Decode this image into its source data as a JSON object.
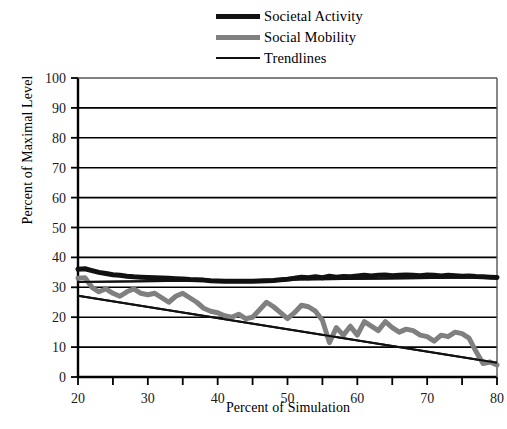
{
  "chart_data": {
    "type": "line",
    "title": "",
    "xlabel": "Percent of Simulation",
    "ylabel": "Percent of Maximal Level",
    "xlim": [
      20,
      80
    ],
    "ylim": [
      0,
      100
    ],
    "xticks": [
      20,
      25,
      30,
      35,
      40,
      45,
      50,
      55,
      60,
      65,
      70,
      75,
      80
    ],
    "xtick_labels": [
      "20",
      "",
      "30",
      "",
      "40",
      "",
      "50",
      "",
      "60",
      "",
      "70",
      "",
      "80"
    ],
    "yticks": [
      0,
      10,
      20,
      30,
      40,
      50,
      60,
      70,
      80,
      90,
      100
    ],
    "ytick_labels": [
      "0",
      "10",
      "20",
      "30",
      "40",
      "50",
      "60",
      "70",
      "80",
      "90",
      "100"
    ],
    "grid": "horizontal",
    "legend_position": "top-center",
    "legend": [
      {
        "label": "Societal Activity",
        "color": "#111111",
        "width": 5
      },
      {
        "label": "Social Mobility",
        "color": "#808080",
        "width": 5
      },
      {
        "label": "Trendlines",
        "color": "#111111",
        "width": 2
      }
    ],
    "x": [
      20,
      21,
      22,
      23,
      24,
      25,
      26,
      27,
      28,
      29,
      30,
      31,
      32,
      33,
      34,
      35,
      36,
      37,
      38,
      39,
      40,
      41,
      42,
      43,
      44,
      45,
      46,
      47,
      48,
      49,
      50,
      51,
      52,
      53,
      54,
      55,
      56,
      57,
      58,
      59,
      60,
      61,
      62,
      63,
      64,
      65,
      66,
      67,
      68,
      69,
      70,
      71,
      72,
      73,
      74,
      75,
      76,
      77,
      78,
      79,
      80
    ],
    "series": [
      {
        "name": "Societal Activity",
        "color": "#111111",
        "width": 5,
        "values": [
          36.0,
          36.2,
          35.6,
          35.0,
          34.6,
          34.2,
          34.0,
          33.7,
          33.5,
          33.4,
          33.3,
          33.2,
          33.1,
          33.0,
          32.9,
          32.8,
          32.6,
          32.5,
          32.4,
          32.2,
          32.1,
          32.0,
          32.0,
          32.0,
          32.0,
          32.0,
          32.1,
          32.2,
          32.3,
          32.5,
          32.7,
          33.0,
          33.4,
          33.2,
          33.5,
          33.2,
          33.7,
          33.4,
          33.6,
          33.5,
          33.8,
          34.0,
          33.8,
          34.0,
          34.1,
          33.9,
          34.0,
          34.1,
          34.0,
          33.9,
          34.1,
          34.0,
          33.8,
          34.0,
          33.9,
          33.7,
          33.8,
          33.6,
          33.5,
          33.4,
          33.3
        ]
      },
      {
        "name": "Social Mobility",
        "color": "#808080",
        "width": 5,
        "values": [
          33.0,
          33.2,
          30.0,
          28.5,
          29.5,
          28.0,
          27.0,
          28.5,
          29.5,
          28.0,
          27.5,
          28.0,
          26.5,
          25.0,
          27.0,
          28.0,
          26.5,
          25.0,
          23.0,
          22.0,
          21.5,
          20.5,
          20.0,
          21.0,
          19.5,
          20.0,
          22.5,
          25.0,
          23.5,
          21.5,
          19.5,
          21.5,
          24.0,
          23.5,
          22.0,
          19.0,
          11.5,
          16.5,
          14.0,
          17.0,
          14.0,
          18.5,
          17.0,
          15.5,
          18.5,
          16.5,
          15.0,
          16.0,
          15.5,
          14.0,
          13.5,
          12.0,
          14.0,
          13.5,
          15.0,
          14.5,
          13.0,
          8.5,
          4.5,
          5.0,
          4.0
        ]
      }
    ],
    "trendlines": [
      {
        "name": "Societal Activity Trendline",
        "color": "#111111",
        "width": 2,
        "x0": 20,
        "y0": 31.8,
        "x1": 80,
        "y1": 33.4
      },
      {
        "name": "Social Mobility Trendline",
        "color": "#111111",
        "width": 2,
        "x0": 20,
        "y0": 27.2,
        "x1": 80,
        "y1": 4.8
      }
    ]
  }
}
